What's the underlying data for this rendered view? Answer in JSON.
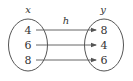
{
  "diagram": {
    "type": "mapping",
    "function_label": "h",
    "domain": {
      "label": "x",
      "values": [
        "4",
        "6",
        "8"
      ]
    },
    "codomain": {
      "label": "y",
      "values": [
        "8",
        "4",
        "6"
      ]
    },
    "mappings": [
      {
        "from": "4",
        "to": "8"
      },
      {
        "from": "6",
        "to": "4"
      },
      {
        "from": "8",
        "to": "6"
      }
    ],
    "colors": {
      "stroke": "#555555",
      "text": "#333333",
      "background": "#ffffff"
    }
  }
}
